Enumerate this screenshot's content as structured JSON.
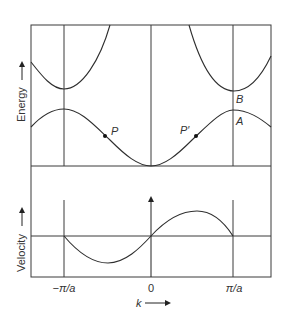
{
  "diagram": {
    "energy_panel": {
      "ylabel": "Energy",
      "points": [
        {
          "id": "P",
          "label": "P"
        },
        {
          "id": "P-prime",
          "label": "P′"
        },
        {
          "id": "A",
          "label": "A"
        },
        {
          "id": "B",
          "label": "B"
        }
      ],
      "bands": [
        "lower band",
        "upper band"
      ]
    },
    "velocity_panel": {
      "ylabel": "Velocity"
    },
    "x_axis": {
      "label": "k",
      "ticks": [
        "−π/a",
        "0",
        "π/a"
      ]
    }
  }
}
